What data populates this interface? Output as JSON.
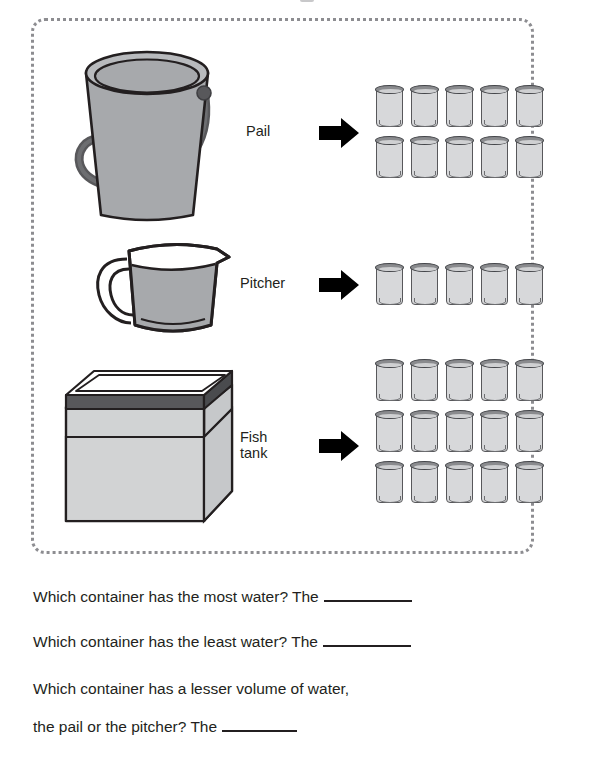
{
  "worksheet": {
    "rows": [
      {
        "id": "pail",
        "label": "Pail",
        "container_icon": "pail-icon",
        "arrow_icon": "right-arrow-icon",
        "glass_count": 10,
        "glass_rows": 2,
        "glass_cols": 5
      },
      {
        "id": "pitcher",
        "label": "Pitcher",
        "container_icon": "pitcher-icon",
        "arrow_icon": "right-arrow-icon",
        "glass_count": 5,
        "glass_rows": 1,
        "glass_cols": 5
      },
      {
        "id": "fishtank",
        "label": "Fish\ntank",
        "container_icon": "fish-tank-icon",
        "arrow_icon": "right-arrow-icon",
        "glass_count": 15,
        "glass_rows": 3,
        "glass_cols": 5
      }
    ]
  },
  "questions": {
    "q1": "Which container has the most water? The",
    "q2": "Which container has the least water? The",
    "q3_line1": "Which container has a lesser volume of water,",
    "q3_line2": "the pail or the pitcher? The"
  },
  "colors": {
    "ink": "#231f20",
    "dotted_border": "#8d8d91",
    "glass_body": "#d7d8da",
    "glass_rim": "#8a8b8e",
    "glass_outline": "#58585b",
    "pail_body": "#a7a9ac",
    "pail_outline": "#231f20",
    "pail_handle": "#58585b",
    "pitcher_water": "#a7a9ac",
    "tank_body": "#d1d3d4",
    "tank_rim": "#58585b",
    "arrow": "#000000"
  }
}
